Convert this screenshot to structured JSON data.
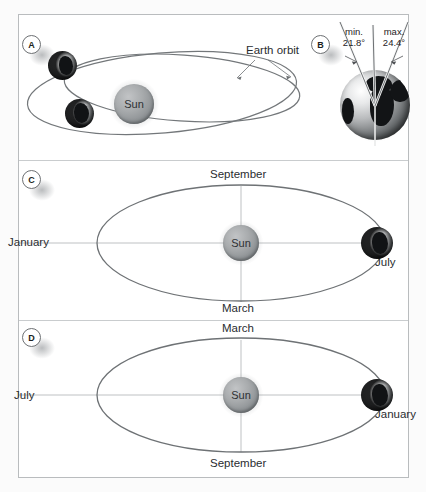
{
  "figure": {
    "background_color": "#fbfbfb",
    "frame_border_color": "#b9bcbe",
    "orbit_color": "#6e7275",
    "axis_line_color": "#b7babc",
    "sun_label": "Sun"
  },
  "panels": [
    {
      "id": "A",
      "badge": "A",
      "kind": "orbit-precession",
      "labels": {
        "annotation": "Earth orbit",
        "sun": "Sun"
      },
      "bodies": [
        {
          "name": "earth-upper",
          "type": "earth"
        },
        {
          "name": "earth-lower",
          "type": "earth"
        },
        {
          "name": "sun",
          "type": "sun",
          "label": "Sun"
        }
      ],
      "ellipses": 2
    },
    {
      "id": "B",
      "badge": "B",
      "kind": "axial-tilt",
      "labels": {
        "min_title": "min.",
        "min_value": "21.8°",
        "max_title": "max.",
        "max_value": "24.4°"
      }
    },
    {
      "id": "C",
      "badge": "C",
      "kind": "orbit-seasons",
      "labels": {
        "top": "September",
        "bottom": "March",
        "left": "January",
        "right": "July",
        "sun": "Sun"
      }
    },
    {
      "id": "D",
      "badge": "D",
      "kind": "orbit-seasons",
      "labels": {
        "top": "March",
        "bottom": "September",
        "left": "July",
        "right": "January",
        "sun": "Sun"
      }
    }
  ]
}
